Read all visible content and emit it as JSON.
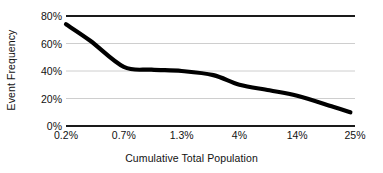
{
  "chart_data": {
    "type": "line",
    "title": "",
    "xlabel": "Cumulative Total Population",
    "ylabel": "Event Frequency",
    "categories": [
      "0.2%",
      "0.7%",
      "1.3%",
      "4%",
      "14%",
      "25%"
    ],
    "x_tick_labels": [
      "0.2%",
      "0.7%",
      "1.3%",
      "4%",
      "14%",
      "25%"
    ],
    "y_tick_labels": [
      "0%",
      "20%",
      "40%",
      "60%",
      "80%"
    ],
    "y_tick_values": [
      0,
      20,
      40,
      60,
      80
    ],
    "ylim": [
      0,
      80
    ],
    "grid": true,
    "legend": false,
    "series": [
      {
        "name": "Event Frequency",
        "values": [
          74,
          43,
          40,
          30,
          22,
          10
        ]
      }
    ],
    "points": [
      {
        "x": "0.2%",
        "y": 74
      },
      {
        "x": "0.4%",
        "y": 62
      },
      {
        "x": "0.7%",
        "y": 43
      },
      {
        "x": "1.0%",
        "y": 41
      },
      {
        "x": "1.3%",
        "y": 40
      },
      {
        "x": "2.5%",
        "y": 37
      },
      {
        "x": "4%",
        "y": 30
      },
      {
        "x": "8%",
        "y": 26
      },
      {
        "x": "14%",
        "y": 22
      },
      {
        "x": "20%",
        "y": 14
      },
      {
        "x": "23%",
        "y": 10
      }
    ],
    "colors": {
      "line": "#000000",
      "grid": "#c8c8c8",
      "axis": "#1a1a1a",
      "background": "#ffffff"
    }
  }
}
